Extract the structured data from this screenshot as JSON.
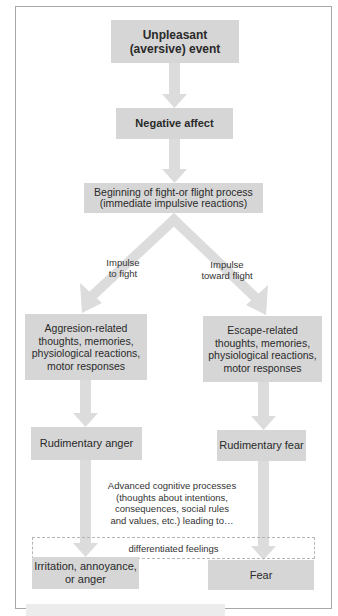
{
  "diagram": {
    "type": "flowchart",
    "colors": {
      "box_fill": "#d6d6d6",
      "arrow_fill": "#dcdcdc",
      "frame_border": "#a8a8a8",
      "text": "#2a2a2a"
    },
    "nodes": {
      "unpleasant_event": "Unpleasant\n(aversive) event",
      "negative_affect": "Negative affect",
      "fight_or_flight": "Beginning of fight-or flight process\n(immediate impulsive reactions)",
      "aggression_related": "Aggresion-related\nthoughts, memories,\nphysiological reactions,\nmotor responses",
      "escape_related": "Escape-related\nthoughts, memories,\nphysiological reactions,\nmotor responses",
      "rudimentary_anger": "Rudimentary anger",
      "rudimentary_fear": "Rudimentary fear",
      "irritation_anger": "Irritation, annoyance,\nor anger",
      "fear": "Fear"
    },
    "edge_labels": {
      "impulse_fight": "Impulse\nto fight",
      "impulse_flight": "Impulse\ntoward flight"
    },
    "annotations": {
      "cognitive_processes": "Advanced cognitive processes\n(thoughts about intentions,\nconsequences, social rules\nand values, etc.) leading to…",
      "differentiated_feelings": "differentiated feelings"
    },
    "edges": [
      [
        "unpleasant_event",
        "negative_affect"
      ],
      [
        "negative_affect",
        "fight_or_flight"
      ],
      [
        "fight_or_flight",
        "aggression_related"
      ],
      [
        "fight_or_flight",
        "escape_related"
      ],
      [
        "aggression_related",
        "rudimentary_anger"
      ],
      [
        "escape_related",
        "rudimentary_fear"
      ],
      [
        "rudimentary_anger",
        "irritation_anger"
      ],
      [
        "rudimentary_fear",
        "fear"
      ]
    ]
  }
}
